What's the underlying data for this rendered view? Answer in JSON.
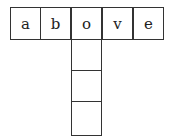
{
  "puzzle": {
    "row_letters": [
      "a",
      "b",
      "o",
      "v",
      "e"
    ],
    "column_blanks": 3
  }
}
